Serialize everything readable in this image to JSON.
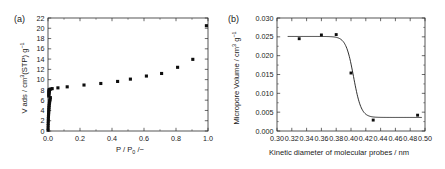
{
  "figure": {
    "panel_a_label": "(a)",
    "panel_b_label": "(b)",
    "point_color": "#0d0d0d",
    "line_color": "#1a1a1a",
    "axis_color": "#2b2b2b"
  },
  "chart_data": [
    {
      "id": "panel-a",
      "type": "scatter",
      "panel_label": "(a)",
      "title": "",
      "xlabel": "P / P0 / −",
      "xlabel_parts": {
        "pre": "P / P",
        "sub": "0",
        "post": " /−"
      },
      "ylabel": "V ads / cm3(STP) g−1",
      "ylabel_parts": {
        "pre": "V ads / cm",
        "sup1": "3",
        "mid": "(STP) g",
        "sup2": "−1"
      },
      "xlim": [
        0.0,
        1.0
      ],
      "ylim": [
        0,
        22
      ],
      "xticks": [
        0.0,
        0.2,
        0.4,
        0.6,
        0.8,
        1.0
      ],
      "xticklabels": [
        "0.0",
        "0.2",
        "0.4",
        "0.6",
        "0.8",
        "1.0"
      ],
      "yticks": [
        0,
        2,
        4,
        6,
        8,
        10,
        12,
        14,
        16,
        18,
        20,
        22
      ],
      "yticklabels": [
        "0",
        "2",
        "4",
        "6",
        "8",
        "10",
        "12",
        "14",
        "16",
        "18",
        "20",
        "22"
      ],
      "grid": false,
      "legend": "none",
      "marker": "square",
      "x": [
        0.0003,
        0.0006,
        0.001,
        0.0014,
        0.0018,
        0.0023,
        0.0028,
        0.0034,
        0.004,
        0.0047,
        0.0055,
        0.0064,
        0.0074,
        0.0085,
        0.0098,
        0.0112,
        0.0128,
        0.0146,
        0.005,
        0.0055,
        0.006,
        0.0065,
        0.007,
        0.0075,
        0.008,
        0.0085,
        0.009,
        0.0165,
        0.026,
        0.062,
        0.12,
        0.225,
        0.33,
        0.435,
        0.515,
        0.615,
        0.71,
        0.81,
        0.905,
        0.99
      ],
      "y": [
        0.15,
        0.55,
        1.05,
        1.5,
        1.95,
        2.4,
        2.8,
        3.2,
        3.55,
        3.9,
        4.25,
        4.6,
        4.95,
        5.3,
        5.6,
        5.9,
        6.2,
        6.5,
        6.8,
        7.05,
        7.3,
        7.5,
        7.7,
        7.85,
        7.95,
        8.05,
        8.1,
        8.15,
        8.25,
        8.4,
        8.6,
        8.95,
        9.25,
        9.65,
        10.1,
        10.7,
        11.2,
        12.4,
        13.95,
        20.5
      ]
    },
    {
      "id": "panel-b",
      "type": "scatter",
      "panel_label": "(b)",
      "title": "",
      "xlabel": "Kinetic diameter of molecular probes / nm",
      "ylabel": "Micropore Volume / cm3 g−1",
      "ylabel_parts": {
        "pre": "Micropore Volume / cm",
        "sup1": "3",
        "mid": " g",
        "sup2": "−1"
      },
      "xlim": [
        0.3,
        0.5
      ],
      "ylim": [
        0.0,
        0.03
      ],
      "xticks": [
        0.3,
        0.32,
        0.34,
        0.36,
        0.38,
        0.4,
        0.42,
        0.44,
        0.46,
        0.48,
        0.5
      ],
      "xticklabels": [
        "0.30",
        "0.32",
        "0.34",
        "0.36",
        "0.38",
        "0.40",
        "0.42",
        "0.44",
        "0.46",
        "0.48",
        "0.50"
      ],
      "yticks": [
        0.0,
        0.005,
        0.01,
        0.015,
        0.02,
        0.025,
        0.03
      ],
      "yticklabels": [
        "0.000",
        "0.005",
        "0.010",
        "0.015",
        "0.020",
        "0.025",
        "0.030"
      ],
      "grid": false,
      "legend": "none",
      "marker": "square",
      "x": [
        0.33,
        0.36,
        0.38,
        0.4,
        0.43,
        0.49
      ],
      "y": [
        0.0245,
        0.0255,
        0.0256,
        0.0154,
        0.0029,
        0.0042
      ],
      "fit_curve": {
        "description": "sigmoid step",
        "upper": 0.0251,
        "lower": 0.0036,
        "center": 0.4035,
        "width": 0.0052,
        "x_start": 0.315,
        "x_end": 0.495
      }
    }
  ]
}
